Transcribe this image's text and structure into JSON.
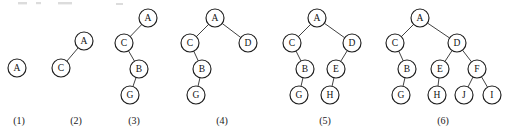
{
  "figure": {
    "width": 505,
    "height": 137,
    "background_color": "#ffffff",
    "node_stroke_color": "#1e1e1e",
    "node_fill_color": "#ffffff",
    "edge_color": "#2b2b2b",
    "label_color": "#111111",
    "node_radius": 9
  },
  "chart_data": {
    "type": "diagram",
    "diagram_kind": "binary-tree-sequence",
    "panel_count": 6,
    "node_labels_all": [
      "A",
      "B",
      "C",
      "D",
      "E",
      "F",
      "G",
      "H",
      "I",
      "J"
    ],
    "panels": [
      {
        "caption": "(1)",
        "caption_x": 19,
        "caption_y": 124,
        "node_count": 1,
        "nodes": [
          {
            "id": "A",
            "label": "A",
            "x": 17,
            "y": 68,
            "depth": 0
          }
        ],
        "edges": []
      },
      {
        "caption": "(2)",
        "caption_x": 76,
        "caption_y": 124,
        "node_count": 2,
        "nodes": [
          {
            "id": "A",
            "label": "A",
            "x": 84,
            "y": 41,
            "depth": 0
          },
          {
            "id": "C",
            "label": "C",
            "x": 61,
            "y": 68,
            "depth": 1
          }
        ],
        "edges": [
          {
            "from": "A",
            "to": "C",
            "side": "left"
          }
        ]
      },
      {
        "caption": "(3)",
        "caption_x": 134,
        "caption_y": 124,
        "node_count": 4,
        "nodes": [
          {
            "id": "A",
            "label": "A",
            "x": 148,
            "y": 18,
            "depth": 0
          },
          {
            "id": "C",
            "label": "C",
            "x": 124,
            "y": 43,
            "depth": 1
          },
          {
            "id": "B",
            "label": "B",
            "x": 139,
            "y": 69,
            "depth": 2
          },
          {
            "id": "G",
            "label": "G",
            "x": 130,
            "y": 95,
            "depth": 3
          }
        ],
        "edges": [
          {
            "from": "A",
            "to": "C",
            "side": "left"
          },
          {
            "from": "C",
            "to": "B",
            "side": "right"
          },
          {
            "from": "B",
            "to": "G",
            "side": "left"
          }
        ]
      },
      {
        "caption": "(4)",
        "caption_x": 222,
        "caption_y": 124,
        "node_count": 5,
        "nodes": [
          {
            "id": "A",
            "label": "A",
            "x": 215,
            "y": 18,
            "depth": 0
          },
          {
            "id": "C",
            "label": "C",
            "x": 190,
            "y": 43,
            "depth": 1
          },
          {
            "id": "D",
            "label": "D",
            "x": 248,
            "y": 43,
            "depth": 1
          },
          {
            "id": "B",
            "label": "B",
            "x": 202,
            "y": 69,
            "depth": 2
          },
          {
            "id": "G",
            "label": "G",
            "x": 196,
            "y": 95,
            "depth": 3
          }
        ],
        "edges": [
          {
            "from": "A",
            "to": "C",
            "side": "left"
          },
          {
            "from": "A",
            "to": "D",
            "side": "right"
          },
          {
            "from": "C",
            "to": "B",
            "side": "right"
          },
          {
            "from": "B",
            "to": "G",
            "side": "left"
          }
        ]
      },
      {
        "caption": "(5)",
        "caption_x": 325,
        "caption_y": 124,
        "node_count": 7,
        "nodes": [
          {
            "id": "A",
            "label": "A",
            "x": 317,
            "y": 18,
            "depth": 0
          },
          {
            "id": "C",
            "label": "C",
            "x": 292,
            "y": 43,
            "depth": 1
          },
          {
            "id": "D",
            "label": "D",
            "x": 352,
            "y": 43,
            "depth": 1
          },
          {
            "id": "B",
            "label": "B",
            "x": 305,
            "y": 69,
            "depth": 2
          },
          {
            "id": "E",
            "label": "E",
            "x": 336,
            "y": 69,
            "depth": 2
          },
          {
            "id": "G",
            "label": "G",
            "x": 299,
            "y": 95,
            "depth": 3
          },
          {
            "id": "H",
            "label": "H",
            "x": 330,
            "y": 95,
            "depth": 3
          }
        ],
        "edges": [
          {
            "from": "A",
            "to": "C",
            "side": "left"
          },
          {
            "from": "A",
            "to": "D",
            "side": "right"
          },
          {
            "from": "C",
            "to": "B",
            "side": "right"
          },
          {
            "from": "B",
            "to": "G",
            "side": "left"
          },
          {
            "from": "D",
            "to": "E",
            "side": "left"
          },
          {
            "from": "E",
            "to": "H",
            "side": "left"
          }
        ]
      },
      {
        "caption": "(6)",
        "caption_x": 443,
        "caption_y": 124,
        "node_count": 10,
        "nodes": [
          {
            "id": "A",
            "label": "A",
            "x": 420,
            "y": 18,
            "depth": 0
          },
          {
            "id": "C",
            "label": "C",
            "x": 395,
            "y": 43,
            "depth": 1
          },
          {
            "id": "D",
            "label": "D",
            "x": 457,
            "y": 43,
            "depth": 1
          },
          {
            "id": "B",
            "label": "B",
            "x": 407,
            "y": 69,
            "depth": 2
          },
          {
            "id": "E",
            "label": "E",
            "x": 440,
            "y": 69,
            "depth": 2
          },
          {
            "id": "F",
            "label": "F",
            "x": 477,
            "y": 69,
            "depth": 2
          },
          {
            "id": "G",
            "label": "G",
            "x": 401,
            "y": 95,
            "depth": 3
          },
          {
            "id": "H",
            "label": "H",
            "x": 437,
            "y": 95,
            "depth": 3
          },
          {
            "id": "J",
            "label": "J",
            "x": 464,
            "y": 95,
            "depth": 3
          },
          {
            "id": "I",
            "label": "I",
            "x": 492,
            "y": 95,
            "depth": 3
          }
        ],
        "edges": [
          {
            "from": "A",
            "to": "C",
            "side": "left"
          },
          {
            "from": "A",
            "to": "D",
            "side": "right"
          },
          {
            "from": "C",
            "to": "B",
            "side": "right"
          },
          {
            "from": "B",
            "to": "G",
            "side": "left"
          },
          {
            "from": "D",
            "to": "E",
            "side": "left"
          },
          {
            "from": "D",
            "to": "F",
            "side": "right"
          },
          {
            "from": "E",
            "to": "H",
            "side": "left"
          },
          {
            "from": "F",
            "to": "J",
            "side": "left"
          },
          {
            "from": "F",
            "to": "I",
            "side": "right"
          }
        ]
      }
    ]
  }
}
